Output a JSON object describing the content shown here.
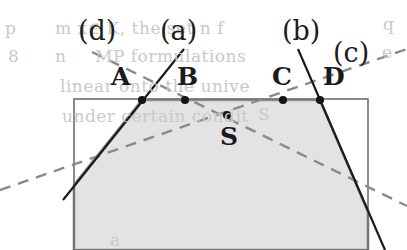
{
  "figure": {
    "background_color": "#ffffff",
    "fill_color": "#e3e3e3",
    "outline_color": "#8f8f8f",
    "rect_color": "#6e6e6e",
    "line_color": "#1b1b1b",
    "dash_color": "#8a8a8a",
    "dot_color": "#141414"
  },
  "line_labels": [
    {
      "id": "d",
      "text": "(d)",
      "x": 78,
      "y": 17
    },
    {
      "id": "a",
      "text": "(a)",
      "x": 160,
      "y": 17
    },
    {
      "id": "b",
      "text": "(b)",
      "x": 282,
      "y": 17
    },
    {
      "id": "c",
      "text": "(c)",
      "x": 333,
      "y": 39
    }
  ],
  "point_labels": [
    {
      "id": "A",
      "text": "A",
      "x": 111,
      "y": 64
    },
    {
      "id": "B",
      "text": "B",
      "x": 177,
      "y": 64
    },
    {
      "id": "C",
      "text": "C",
      "x": 272,
      "y": 64
    },
    {
      "id": "D",
      "text": "D",
      "x": 323,
      "y": 64
    },
    {
      "id": "S",
      "text": "S",
      "x": 220,
      "y": 124
    }
  ],
  "points": [
    {
      "id": "A",
      "x": 142,
      "y": 100
    },
    {
      "id": "B",
      "x": 185,
      "y": 100
    },
    {
      "id": "C",
      "x": 283,
      "y": 100
    },
    {
      "id": "D",
      "x": 320,
      "y": 100
    },
    {
      "id": "S",
      "x": 227,
      "y": 115
    }
  ],
  "rectangle": {
    "x": 74,
    "y": 99,
    "width": 294,
    "height": 151
  },
  "region_polygon": "74,250 74,185 142,100 320,100 368,212 368,250",
  "solid_lines": [
    {
      "id": "a",
      "x1": 184,
      "y1": 49,
      "x2": 63,
      "y2": 200
    },
    {
      "id": "b",
      "x1": 298,
      "y1": 49,
      "x2": 385,
      "y2": 250
    }
  ],
  "dashed_lines": [
    {
      "id": "d",
      "x1": 92,
      "y1": 52,
      "x2": 407,
      "y2": 206
    },
    {
      "id": "c",
      "x1": 0,
      "y1": 190,
      "x2": 407,
      "y2": 49
    }
  ],
  "ghost_text": [
    {
      "text": "p",
      "x": 5,
      "y": 20
    },
    {
      "text": "m  x∈ K, the set  n  f",
      "x": 55,
      "y": 20
    },
    {
      "text": "q",
      "x": 383,
      "y": 16
    },
    {
      "text": "8",
      "x": 8,
      "y": 48
    },
    {
      "text": "n",
      "x": 55,
      "y": 48
    },
    {
      "text": "MP formulations",
      "x": 95,
      "y": 48
    },
    {
      "text": "e",
      "x": 382,
      "y": 44
    },
    {
      "text": "linear onto the unive",
      "x": 60,
      "y": 78
    },
    {
      "text": "under certain condit",
      "x": 62,
      "y": 108
    },
    {
      "text": "S",
      "x": 258,
      "y": 106
    },
    {
      "text": "a",
      "x": 110,
      "y": 232
    }
  ]
}
